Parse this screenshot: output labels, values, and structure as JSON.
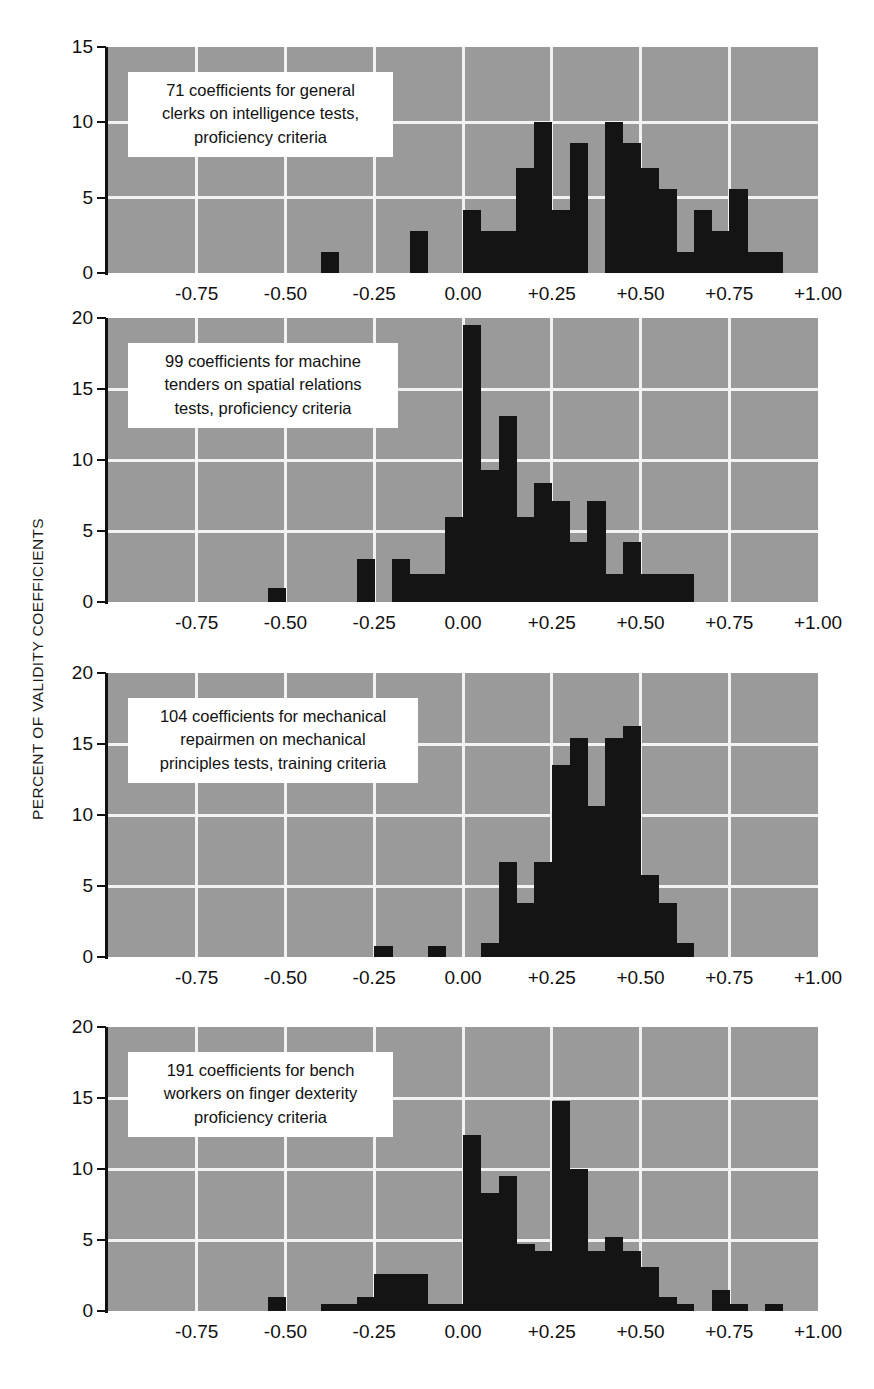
{
  "figure": {
    "ylabel": "PERCENT OF VALIDITY COEFFICIENTS",
    "background_color": "#9a9a9a",
    "bar_color": "#141414",
    "grid_color": "#f2f2f2"
  },
  "chart_data": [
    {
      "type": "bar",
      "panel_index": 1,
      "title": "71 coefficients for general\nclerks on intelligence tests,\nproficiency criteria",
      "n": 71,
      "xlabel": "",
      "ylabel": "PERCENT OF VALIDITY COEFFICIENTS",
      "xlim": [
        -1.0,
        1.0
      ],
      "ylim": [
        0,
        15
      ],
      "xticks": [
        "-0.75",
        "-0.50",
        "-0.25",
        "0.00",
        "+0.25",
        "+0.50",
        "+0.75",
        "+1.00"
      ],
      "xtick_values": [
        -0.75,
        -0.5,
        -0.25,
        0.0,
        0.25,
        0.5,
        0.75,
        1.0
      ],
      "yticks": [
        "0",
        "5",
        "10",
        "15"
      ],
      "ytick_values": [
        0,
        5,
        10,
        15
      ],
      "bin_width": 0.05,
      "grid": true,
      "bins": [
        {
          "x": -0.4,
          "value": 1.4
        },
        {
          "x": -0.15,
          "value": 2.8
        },
        {
          "x": 0.0,
          "value": 4.2
        },
        {
          "x": 0.05,
          "value": 2.8
        },
        {
          "x": 0.1,
          "value": 2.8
        },
        {
          "x": 0.15,
          "value": 7.0
        },
        {
          "x": 0.2,
          "value": 10.0
        },
        {
          "x": 0.25,
          "value": 4.2
        },
        {
          "x": 0.3,
          "value": 8.6
        },
        {
          "x": 0.35,
          "value": 0.0
        },
        {
          "x": 0.4,
          "value": 10.0
        },
        {
          "x": 0.45,
          "value": 8.6
        },
        {
          "x": 0.5,
          "value": 7.0
        },
        {
          "x": 0.55,
          "value": 5.6
        },
        {
          "x": 0.6,
          "value": 1.4
        },
        {
          "x": 0.65,
          "value": 4.2
        },
        {
          "x": 0.7,
          "value": 2.8
        },
        {
          "x": 0.75,
          "value": 5.6
        },
        {
          "x": 0.8,
          "value": 1.4
        },
        {
          "x": 0.85,
          "value": 1.4
        }
      ]
    },
    {
      "type": "bar",
      "panel_index": 2,
      "title": "99 coefficients for machine\ntenders on spatial relations\ntests, proficiency criteria",
      "n": 99,
      "xlabel": "",
      "ylabel": "PERCENT OF VALIDITY COEFFICIENTS",
      "xlim": [
        -1.0,
        1.0
      ],
      "ylim": [
        0,
        20
      ],
      "xticks": [
        "-0.75",
        "-0.50",
        "-0.25",
        "0.00",
        "+0.25",
        "+0.50",
        "+0.75",
        "+1.00"
      ],
      "xtick_values": [
        -0.75,
        -0.5,
        -0.25,
        0.0,
        0.25,
        0.5,
        0.75,
        1.0
      ],
      "yticks": [
        "0",
        "5",
        "10",
        "15",
        "20"
      ],
      "ytick_values": [
        0,
        5,
        10,
        15,
        20
      ],
      "bin_width": 0.05,
      "grid": true,
      "bins": [
        {
          "x": -0.55,
          "value": 1.0
        },
        {
          "x": -0.3,
          "value": 3.0
        },
        {
          "x": -0.2,
          "value": 3.0
        },
        {
          "x": -0.15,
          "value": 2.0
        },
        {
          "x": -0.1,
          "value": 2.0
        },
        {
          "x": -0.05,
          "value": 6.0
        },
        {
          "x": 0.0,
          "value": 19.5
        },
        {
          "x": 0.05,
          "value": 9.3
        },
        {
          "x": 0.1,
          "value": 13.1
        },
        {
          "x": 0.15,
          "value": 6.0
        },
        {
          "x": 0.2,
          "value": 8.4
        },
        {
          "x": 0.25,
          "value": 7.1
        },
        {
          "x": 0.3,
          "value": 4.2
        },
        {
          "x": 0.35,
          "value": 7.1
        },
        {
          "x": 0.4,
          "value": 2.0
        },
        {
          "x": 0.45,
          "value": 4.2
        },
        {
          "x": 0.5,
          "value": 2.0
        },
        {
          "x": 0.55,
          "value": 2.0
        },
        {
          "x": 0.6,
          "value": 2.0
        }
      ]
    },
    {
      "type": "bar",
      "panel_index": 3,
      "title": "104 coefficients for mechanical\nrepairmen on mechanical\nprinciples tests, training criteria",
      "n": 104,
      "xlabel": "",
      "ylabel": "PERCENT OF VALIDITY COEFFICIENTS",
      "xlim": [
        -1.0,
        1.0
      ],
      "ylim": [
        0,
        20
      ],
      "xticks": [
        "-0.75",
        "-0.50",
        "-0.25",
        "0.00",
        "+0.25",
        "+0.50",
        "+0.75",
        "+1.00"
      ],
      "xtick_values": [
        -0.75,
        -0.5,
        -0.25,
        0.0,
        0.25,
        0.5,
        0.75,
        1.0
      ],
      "yticks": [
        "0",
        "5",
        "10",
        "15",
        "20"
      ],
      "ytick_values": [
        0,
        5,
        10,
        15,
        20
      ],
      "bin_width": 0.05,
      "grid": true,
      "bins": [
        {
          "x": -0.25,
          "value": 0.8
        },
        {
          "x": -0.1,
          "value": 0.8
        },
        {
          "x": 0.05,
          "value": 1.0
        },
        {
          "x": 0.1,
          "value": 6.7
        },
        {
          "x": 0.15,
          "value": 3.8
        },
        {
          "x": 0.2,
          "value": 6.7
        },
        {
          "x": 0.25,
          "value": 13.5
        },
        {
          "x": 0.3,
          "value": 15.4
        },
        {
          "x": 0.35,
          "value": 10.6
        },
        {
          "x": 0.4,
          "value": 15.4
        },
        {
          "x": 0.45,
          "value": 16.3
        },
        {
          "x": 0.5,
          "value": 5.8
        },
        {
          "x": 0.55,
          "value": 3.8
        },
        {
          "x": 0.6,
          "value": 1.0
        }
      ]
    },
    {
      "type": "bar",
      "panel_index": 4,
      "title": "191 coefficients for bench\nworkers on finger dexterity\nproficiency criteria",
      "n": 191,
      "xlabel": "",
      "ylabel": "PERCENT OF VALIDITY COEFFICIENTS",
      "xlim": [
        -1.0,
        1.0
      ],
      "ylim": [
        0,
        20
      ],
      "xticks": [
        "-0.75",
        "-0.50",
        "-0.25",
        "0.00",
        "+0.25",
        "+0.50",
        "+0.75",
        "+1.00"
      ],
      "xtick_values": [
        -0.75,
        -0.5,
        -0.25,
        0.0,
        0.25,
        0.5,
        0.75,
        1.0
      ],
      "yticks": [
        "0",
        "5",
        "10",
        "15",
        "20"
      ],
      "ytick_values": [
        0,
        5,
        10,
        15,
        20
      ],
      "bin_width": 0.05,
      "grid": true,
      "bins": [
        {
          "x": -0.55,
          "value": 1.0
        },
        {
          "x": -0.4,
          "value": 0.5
        },
        {
          "x": -0.35,
          "value": 0.5
        },
        {
          "x": -0.3,
          "value": 1.0
        },
        {
          "x": -0.25,
          "value": 2.6
        },
        {
          "x": -0.2,
          "value": 2.6
        },
        {
          "x": -0.15,
          "value": 2.6
        },
        {
          "x": -0.1,
          "value": 0.5
        },
        {
          "x": -0.05,
          "value": 0.5
        },
        {
          "x": 0.0,
          "value": 12.4
        },
        {
          "x": 0.05,
          "value": 8.3
        },
        {
          "x": 0.1,
          "value": 9.5
        },
        {
          "x": 0.15,
          "value": 4.7
        },
        {
          "x": 0.2,
          "value": 4.2
        },
        {
          "x": 0.25,
          "value": 14.8
        },
        {
          "x": 0.3,
          "value": 10.0
        },
        {
          "x": 0.35,
          "value": 4.2
        },
        {
          "x": 0.4,
          "value": 5.2
        },
        {
          "x": 0.45,
          "value": 4.2
        },
        {
          "x": 0.5,
          "value": 3.1
        },
        {
          "x": 0.55,
          "value": 1.0
        },
        {
          "x": 0.6,
          "value": 0.5
        },
        {
          "x": 0.7,
          "value": 1.5
        },
        {
          "x": 0.75,
          "value": 0.5
        },
        {
          "x": 0.85,
          "value": 0.5
        }
      ]
    }
  ]
}
